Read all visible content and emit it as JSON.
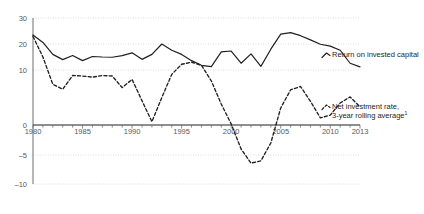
{
  "chart_data": {
    "type": "line",
    "title": "",
    "subtitle": "",
    "xlabel": "",
    "ylabel": "",
    "grid": true,
    "legend_position": "right",
    "xlim": [
      1980,
      2013
    ],
    "ylim": [
      -10,
      30
    ],
    "x_ticks": [
      1980,
      1985,
      1990,
      1995,
      2000,
      2005,
      2010,
      2013
    ],
    "x_tick_labels": [
      "1980",
      "1985",
      "1990",
      "1995",
      "2000",
      "2005",
      "2010",
      "2013"
    ],
    "x_minor_tick_step": 1,
    "y_ticks": [
      30,
      20,
      10,
      0,
      -5,
      -10
    ],
    "y_tick_labels": [
      "30",
      "20",
      "10",
      "0",
      "–5",
      "–10"
    ],
    "zero_axis_value": 0,
    "x": [
      1980,
      1981,
      1982,
      1983,
      1984,
      1985,
      1986,
      1987,
      1988,
      1989,
      1990,
      1991,
      1992,
      1993,
      1994,
      1995,
      1996,
      1997,
      1998,
      1999,
      2000,
      2001,
      2002,
      2003,
      2004,
      2005,
      2006,
      2007,
      2008,
      2009,
      2010,
      2011,
      2012,
      2013
    ],
    "series": [
      {
        "name": "Return on invested capital",
        "style": "solid",
        "color": "#231f20",
        "values": [
          23.5,
          20.6,
          16.0,
          14.0,
          15.6,
          13.6,
          15.2,
          15.0,
          14.9,
          15.5,
          16.6,
          14.1,
          16.0,
          20.0,
          17.6,
          16.0,
          13.6,
          11.8,
          11.3,
          17.0,
          17.3,
          12.6,
          16.2,
          11.4,
          18.0,
          23.8,
          24.4,
          23.2,
          21.6,
          19.9,
          19.2,
          17.6,
          12.6,
          11.2
        ]
      },
      {
        "name": "Net investment rate, 3-year rolling average",
        "name_footnote": "1",
        "style": "dashed",
        "color": "#231f20",
        "values": [
          22.9,
          15.0,
          7.4,
          6.5,
          9.0,
          8.9,
          8.7,
          9.0,
          8.9,
          6.8,
          8.3,
          4.4,
          0.6,
          5.0,
          9.2,
          12.2,
          13.0,
          11.8,
          8.0,
          3.8,
          0.2,
          -4.0,
          -6.4,
          -6.0,
          -3.0,
          3.1,
          6.4,
          7.0,
          4.3,
          1.3,
          1.8,
          4.0,
          5.1,
          3.3
        ]
      }
    ],
    "legend": [
      {
        "label": "Return on invested capital",
        "style": "solid"
      },
      {
        "label": "Net investment rate,",
        "label2": "3-year rolling average",
        "footnote": "1",
        "style": "dashed"
      }
    ],
    "colors": {
      "line": "#231f20",
      "grid": "#c7c8ca",
      "axis": "#6d6e71",
      "tick_text": "#58595b",
      "legend_text": "#231f20",
      "background": "#ffffff"
    },
    "geometry": {
      "plot_left": 33,
      "plot_right": 360,
      "y_top_px": 18,
      "y_for_30": 18,
      "y_for_20": 44,
      "y_for_10": 70,
      "y_for_0": 125,
      "y_for_minus5": 155,
      "y_for_minus10": 184,
      "x_axis_label_y": 134,
      "legend_x": 332,
      "legend_solid_y": 54,
      "legend_dashed_y": 106
    }
  }
}
